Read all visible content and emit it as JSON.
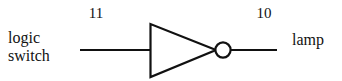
{
  "diagram": {
    "background_color": "#ffffff",
    "stroke_color": "#111111",
    "labels": {
      "input_label_line1": "logic",
      "input_label_line2": "switch",
      "output_label": "lamp",
      "input_pin_number": "11",
      "output_pin_number": "10"
    },
    "components": [
      {
        "name": "input-wire",
        "type": "wire",
        "x1": 80,
        "y1": 50,
        "x2": 150,
        "y2": 50
      },
      {
        "name": "inverter-gate",
        "type": "not-gate-triangle",
        "points": "150,24 150,77 215,50"
      },
      {
        "name": "inversion-bubble",
        "type": "circle",
        "cx": 223,
        "cy": 50,
        "r": 8
      },
      {
        "name": "output-wire",
        "type": "wire",
        "x1": 231,
        "y1": 50,
        "x2": 277,
        "y2": 50
      }
    ]
  }
}
